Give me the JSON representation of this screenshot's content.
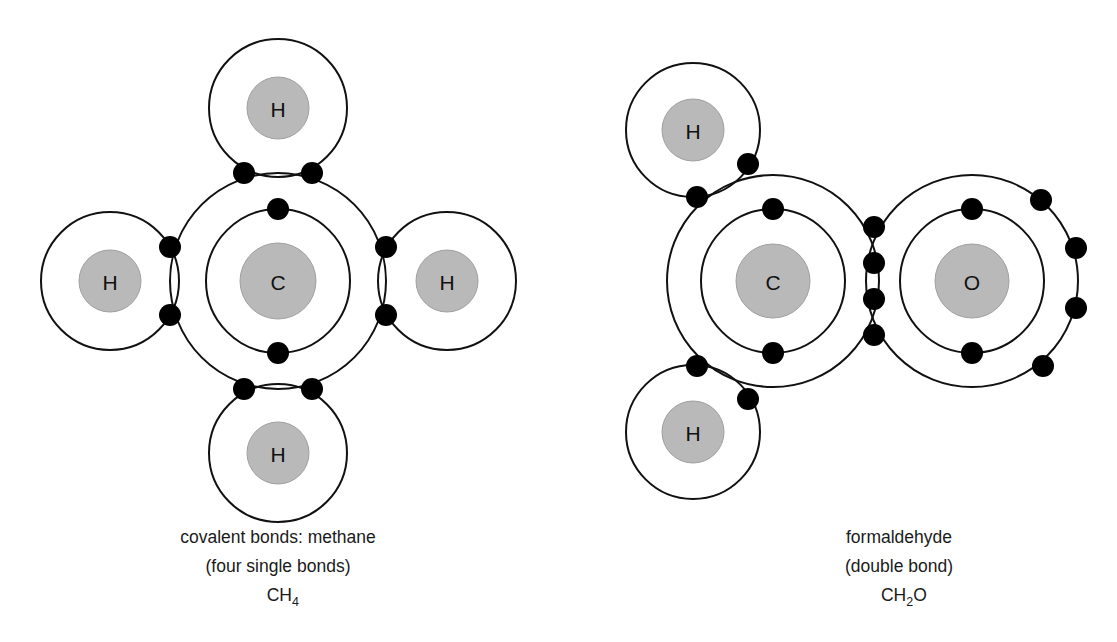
{
  "figure": {
    "background_color": "#ffffff",
    "line_color": "#111111",
    "nucleus_color": "#b9b9b9",
    "electron_color": "#000000"
  },
  "diagrams": [
    {
      "id": "methane",
      "caption_line1": "covalent bonds: methane",
      "caption_line2": "(four single bonds)",
      "formula_main": "CH",
      "formula_sub": "4",
      "formula_tail": "",
      "atoms": [
        {
          "symbol": "C",
          "role": "central",
          "position": "center",
          "inner_shell_electrons": 2,
          "outer_shell_electrons": 8
        },
        {
          "symbol": "H",
          "role": "terminal",
          "position": "top",
          "shell_electrons": 2
        },
        {
          "symbol": "H",
          "role": "terminal",
          "position": "left",
          "shell_electrons": 2
        },
        {
          "symbol": "H",
          "role": "terminal",
          "position": "right",
          "shell_electrons": 2
        },
        {
          "symbol": "H",
          "role": "terminal",
          "position": "bottom",
          "shell_electrons": 2
        }
      ],
      "bonds": [
        {
          "between": "C-H",
          "type": "single",
          "shared_electrons": 2,
          "position": "top"
        },
        {
          "between": "C-H",
          "type": "single",
          "shared_electrons": 2,
          "position": "left"
        },
        {
          "between": "C-H",
          "type": "single",
          "shared_electrons": 2,
          "position": "right"
        },
        {
          "between": "C-H",
          "type": "single",
          "shared_electrons": 2,
          "position": "bottom"
        }
      ]
    },
    {
      "id": "formaldehyde",
      "caption_line1": "formaldehyde",
      "caption_line2": "(double bond)",
      "formula_main": "CH",
      "formula_sub": "2",
      "formula_tail": "O",
      "atoms": [
        {
          "symbol": "H",
          "role": "terminal",
          "position": "upper-left",
          "shell_electrons": 2
        },
        {
          "symbol": "H",
          "role": "terminal",
          "position": "lower-left",
          "shell_electrons": 2
        },
        {
          "symbol": "C",
          "role": "central",
          "position": "center-left",
          "inner_shell_electrons": 2,
          "outer_shell_electrons": 8
        },
        {
          "symbol": "O",
          "role": "central",
          "position": "right",
          "inner_shell_electrons": 2,
          "outer_shell_electrons": 8,
          "lone_electrons": 4
        }
      ],
      "bonds": [
        {
          "between": "C-H",
          "type": "single",
          "shared_electrons": 2,
          "position": "upper-left"
        },
        {
          "between": "C-H",
          "type": "single",
          "shared_electrons": 2,
          "position": "lower-left"
        },
        {
          "between": "C-O",
          "type": "double",
          "shared_electrons": 4,
          "position": "right"
        }
      ]
    }
  ]
}
